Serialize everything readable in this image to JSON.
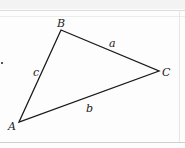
{
  "diagram": {
    "type": "triangle",
    "vertices": [
      {
        "label": "A",
        "x": 19,
        "y": 122
      },
      {
        "label": "B",
        "x": 61,
        "y": 30
      },
      {
        "label": "C",
        "x": 159,
        "y": 71
      }
    ],
    "sides": [
      {
        "label": "a",
        "from": "B",
        "to": "C"
      },
      {
        "label": "b",
        "from": "A",
        "to": "C"
      },
      {
        "label": "c",
        "from": "A",
        "to": "B"
      }
    ],
    "colors": {
      "stroke": "#1a1a1a",
      "background": "#fdfdfd",
      "rule": "#dcdcdc"
    }
  },
  "labels": {
    "A": "A",
    "B": "B",
    "C": "C",
    "a": "a",
    "b": "b",
    "c": "c"
  }
}
